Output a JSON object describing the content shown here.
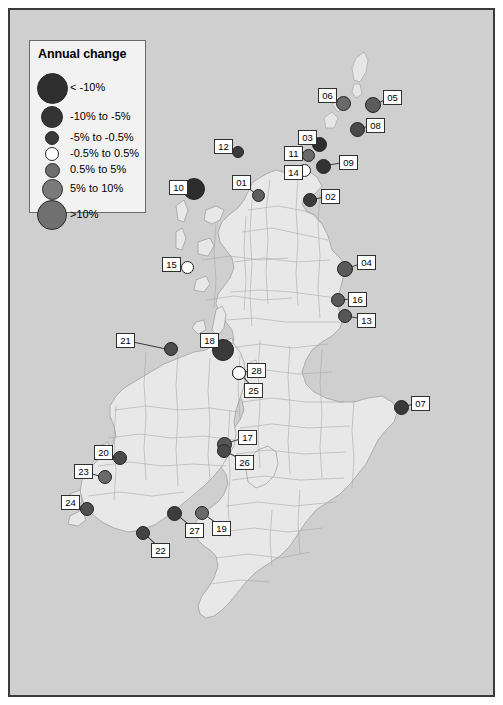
{
  "figure": {
    "kind": "choropleth-proportional-symbol-map",
    "region": "British Isles (United Kingdom and Ireland)",
    "background_color": "#cfcfcf",
    "land_color": "#e8e8e8",
    "boundary_color": "#9a9a9a",
    "frame_color": "#3a3a3a"
  },
  "legend": {
    "title": "Annual change",
    "box_fill": "#f2f2f2",
    "box_border": "#6a6a6a",
    "classes": [
      {
        "label": "< -10%",
        "radius": 15.5,
        "color": "#2e2e2e",
        "cy": 47
      },
      {
        "label": "-10% to -5%",
        "radius": 11.0,
        "color": "#333333",
        "cy": 76
      },
      {
        "label": "-5% to -0.5%",
        "radius": 7.0,
        "color": "#3a3a3a",
        "cy": 97
      },
      {
        "label": "-0.5% to 0.5%",
        "radius": 7.0,
        "color": "#ffffff",
        "cy": 113
      },
      {
        "label": "0.5% to 5%",
        "radius": 7.5,
        "color": "#6e6e6e",
        "cy": 129
      },
      {
        "label": "5% to 10%",
        "radius": 10.5,
        "color": "#7a7a7a",
        "cy": 148
      },
      {
        "label": ">10%",
        "radius": 15.0,
        "color": "#707070",
        "cy": 174
      }
    ]
  },
  "markers": [
    {
      "id": "01",
      "x": 248,
      "y": 185,
      "r": 6.5,
      "color": "#5e5e5e",
      "lx": 222,
      "ly": 165
    },
    {
      "id": "02",
      "x": 300,
      "y": 190,
      "r": 7.0,
      "color": "#3c3c3c",
      "lx": 311,
      "ly": 179
    },
    {
      "id": "03",
      "x": 309,
      "y": 134,
      "r": 7.5,
      "color": "#2f2f2f",
      "lx": 288,
      "ly": 120
    },
    {
      "id": "04",
      "x": 335,
      "y": 259,
      "r": 8.0,
      "color": "#5a5a5a",
      "lx": 347,
      "ly": 245
    },
    {
      "id": "05",
      "x": 363,
      "y": 95,
      "r": 8.0,
      "color": "#5c5c5c",
      "lx": 373,
      "ly": 80
    },
    {
      "id": "06",
      "x": 333,
      "y": 93,
      "r": 7.5,
      "color": "#6a6a6a",
      "lx": 308,
      "ly": 78
    },
    {
      "id": "07",
      "x": 391,
      "y": 397,
      "r": 7.5,
      "color": "#3a3a3a",
      "lx": 401,
      "ly": 386
    },
    {
      "id": "08",
      "x": 347,
      "y": 119,
      "r": 7.5,
      "color": "#4a4a4a",
      "lx": 356,
      "ly": 108
    },
    {
      "id": "09",
      "x": 313,
      "y": 156,
      "r": 7.5,
      "color": "#333333",
      "lx": 329,
      "ly": 145
    },
    {
      "id": "10",
      "x": 184,
      "y": 179,
      "r": 11.0,
      "color": "#2d2d2d",
      "lx": 159,
      "ly": 170
    },
    {
      "id": "11",
      "x": 298,
      "y": 145,
      "r": 6.5,
      "color": "#6a6a6a",
      "lx": 274,
      "ly": 136
    },
    {
      "id": "12",
      "x": 228,
      "y": 142,
      "r": 6.0,
      "color": "#3a3a3a",
      "lx": 204,
      "ly": 129
    },
    {
      "id": "13",
      "x": 335,
      "y": 306,
      "r": 7.0,
      "color": "#565656",
      "lx": 347,
      "ly": 303
    },
    {
      "id": "14",
      "x": 294,
      "y": 160,
      "r": 6.5,
      "color": "#ffffff",
      "lx": 274,
      "ly": 155
    },
    {
      "id": "15",
      "x": 177,
      "y": 257,
      "r": 6.5,
      "color": "#ffffff",
      "lx": 152,
      "ly": 247
    },
    {
      "id": "16",
      "x": 328,
      "y": 290,
      "r": 7.0,
      "color": "#5a5a5a",
      "lx": 338,
      "ly": 282
    },
    {
      "id": "17",
      "x": 214,
      "y": 434,
      "r": 7.5,
      "color": "#585858",
      "lx": 228,
      "ly": 420
    },
    {
      "id": "18",
      "x": 213,
      "y": 340,
      "r": 11.0,
      "color": "#3a3a3a",
      "lx": 190,
      "ly": 323
    },
    {
      "id": "19",
      "x": 192,
      "y": 503,
      "r": 7.0,
      "color": "#6a6a6a",
      "lx": 202,
      "ly": 511
    },
    {
      "id": "20",
      "x": 110,
      "y": 448,
      "r": 7.0,
      "color": "#4a4a4a",
      "lx": 84,
      "ly": 435
    },
    {
      "id": "21",
      "x": 161,
      "y": 339,
      "r": 7.0,
      "color": "#4c4c4c",
      "lx": 106,
      "ly": 323
    },
    {
      "id": "22",
      "x": 133,
      "y": 523,
      "r": 7.0,
      "color": "#434343",
      "lx": 141,
      "ly": 533
    },
    {
      "id": "23",
      "x": 95,
      "y": 467,
      "r": 7.0,
      "color": "#6a6a6a",
      "lx": 64,
      "ly": 454
    },
    {
      "id": "24",
      "x": 77,
      "y": 499,
      "r": 7.0,
      "color": "#4f4f4f",
      "lx": 51,
      "ly": 485
    },
    {
      "id": "25",
      "x": 229,
      "y": 363,
      "r": 7.0,
      "color": "#ffffff",
      "lx": 234,
      "ly": 373
    },
    {
      "id": "26",
      "x": 214,
      "y": 441,
      "r": 7.0,
      "color": "#4a4a4a",
      "lx": 225,
      "ly": 445
    },
    {
      "id": "27",
      "x": 164,
      "y": 503,
      "r": 7.5,
      "color": "#3d3d3d",
      "lx": 175,
      "ly": 513
    },
    {
      "id": "28",
      "x": 229,
      "y": 363,
      "r": 7.0,
      "color": "#ffffff",
      "lx": 237,
      "ly": 353
    }
  ]
}
